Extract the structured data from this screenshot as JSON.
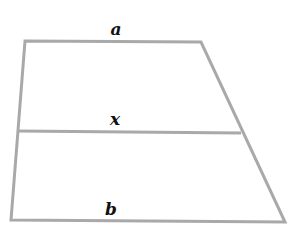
{
  "figure": {
    "type": "trapezoid-with-midline",
    "stroke_color": "#a9a9a9",
    "stroke_width": 3,
    "background": "#ffffff",
    "label_color": "#111111",
    "vertices": {
      "top_left": [
        25,
        41
      ],
      "top_right": [
        201,
        42
      ],
      "bottom_right": [
        285,
        222
      ],
      "bottom_left": [
        11,
        220
      ]
    },
    "midline": {
      "left": [
        17,
        131
      ],
      "right": [
        241,
        133
      ]
    },
    "labels": {
      "top": {
        "text": "a",
        "x": 116,
        "y": 29
      },
      "middle": {
        "text": "x",
        "x": 115,
        "y": 119
      },
      "bottom": {
        "text": "b",
        "x": 111,
        "y": 209
      }
    }
  }
}
